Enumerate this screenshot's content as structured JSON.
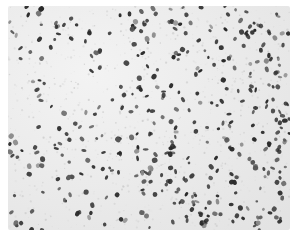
{
  "image": {
    "type": "micrograph",
    "description": "grayscale histology section with densely scattered dark-stained cell nuclei on a pale fibrillary background",
    "colors": {
      "background": "#ffffff",
      "tissue": "#e8e8e8",
      "nucleus_dark": "#2a2a2a",
      "nucleus_mid": "#555555",
      "nucleus_light": "#8a8a8a"
    },
    "nuclei_count_estimate": 420,
    "seed": 17
  }
}
